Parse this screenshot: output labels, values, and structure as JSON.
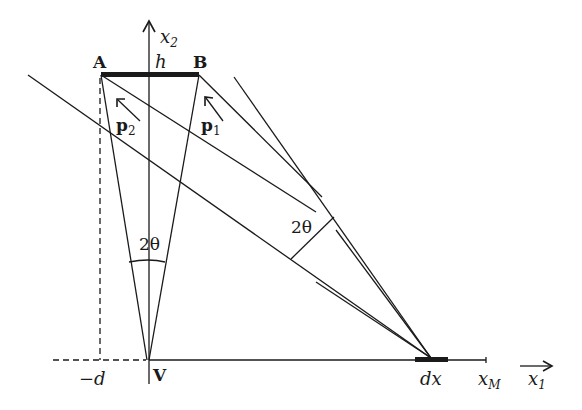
{
  "diagram": {
    "type": "geometric-optics-projection",
    "colors": {
      "ink": "#1a1a1a",
      "background": "#ffffff"
    },
    "points": {
      "A": {
        "label": "A"
      },
      "B": {
        "label": "B"
      },
      "V": {
        "label": "V"
      }
    },
    "labels": {
      "h": "h",
      "x2": "x",
      "x2_sub": "2",
      "x1": "x",
      "x1_sub": "1",
      "xM": "x",
      "xM_sub": "M",
      "minus_d": "−d",
      "dx": "dx",
      "p1": "p",
      "p1_sub": "1",
      "p2": "p",
      "p2_sub": "2",
      "angle_left": "2θ",
      "angle_right": "2θ"
    },
    "elements": [
      "segment AB (thick bar of height h)",
      "vertical axis x2 through V",
      "horizontal axis x1 with xM tick",
      "dashed line from A down to -d",
      "dashed horizontal to -d",
      "cone from V to A and B with angle 2θ",
      "cone from dx with angle 2θ",
      "direction vectors p1 and p2"
    ]
  }
}
